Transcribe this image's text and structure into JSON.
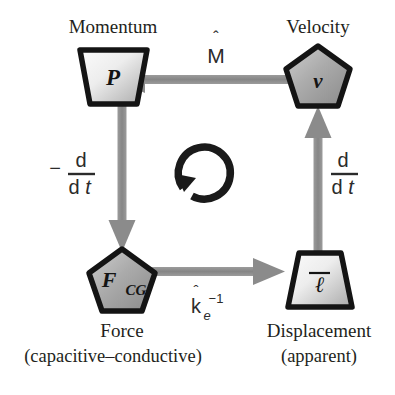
{
  "diagram": {
    "background_color": "#ffffff",
    "node_border_color": "#141414",
    "node_fill_light": "#f2f2f2",
    "node_fill_dark": "#9a9a9a",
    "arrow_color": "#8b8b8b",
    "text_color": "#231f20",
    "cycle_arrow_color": "#1a1a1a",
    "nodes": [
      {
        "id": "momentum",
        "shape": "trapezoid-down",
        "symbol": "P",
        "caption": "Momentum",
        "caption_sub": "",
        "position": "top-left"
      },
      {
        "id": "velocity",
        "shape": "pentagon",
        "symbol": "v",
        "caption": "Velocity",
        "caption_sub": "",
        "position": "top-right"
      },
      {
        "id": "force",
        "shape": "pentagon",
        "symbol": "F",
        "symbol_subscript": "CG",
        "caption": "Force",
        "caption_sub": "(capacitive–conductive)",
        "position": "bottom-left"
      },
      {
        "id": "displacement",
        "shape": "trapezoid-up",
        "symbol": "ℓ",
        "symbol_overbar": true,
        "caption": "Displacement",
        "caption_sub": "(apparent)",
        "position": "bottom-right"
      }
    ],
    "edges": [
      {
        "id": "velocity-to-momentum",
        "from": "velocity",
        "to": "momentum",
        "direction": "left",
        "label_base": "M",
        "label_accent": "ˆ",
        "label_text": "M̂"
      },
      {
        "id": "momentum-to-force",
        "from": "momentum",
        "to": "force",
        "direction": "down",
        "label_sign": "−",
        "label_numerator": "d",
        "label_denominator_d": "d",
        "label_denominator_t": "t",
        "label_text": "−d/dt"
      },
      {
        "id": "force-to-displacement",
        "from": "force",
        "to": "displacement",
        "direction": "right",
        "label_base": "k",
        "label_accent": "ˆ",
        "label_subscript": "e",
        "label_superscript": "−1",
        "label_text": "k̂ₑ⁻¹"
      },
      {
        "id": "displacement-to-velocity",
        "from": "displacement",
        "to": "velocity",
        "direction": "up",
        "label_numerator": "d",
        "label_denominator_d": "d",
        "label_denominator_t": "t",
        "label_text": "d/dt"
      }
    ],
    "cycle_indicator": {
      "id": "cycle-arrow",
      "rotation": "counterclockwise",
      "label": ""
    }
  }
}
